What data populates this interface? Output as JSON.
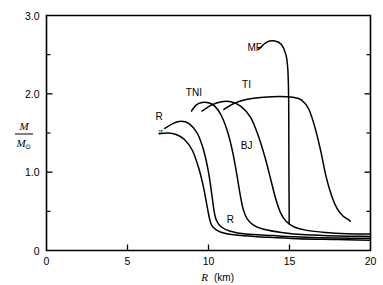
{
  "chart_data": {
    "type": "line",
    "title": "",
    "subtitle": "",
    "xlabel": "R",
    "xunit": "(km)",
    "ylabel_numerator": "M",
    "ylabel_denominator": "M",
    "ylabel_denominator_sub": "⊙",
    "xlim": [
      0,
      20
    ],
    "ylim": [
      0,
      3.0
    ],
    "x_ticks": [
      0,
      5,
      10,
      15,
      20
    ],
    "x_tick_labels": [
      "0",
      "5",
      "10",
      "15",
      "20"
    ],
    "x_minor_ticks": [],
    "y_ticks": [
      0,
      1.0,
      2.0,
      3.0
    ],
    "y_tick_labels": [
      "0",
      "1.0",
      "2.0",
      "3.0"
    ],
    "y_minor_ticks": [
      0.5,
      1.5,
      2.5
    ],
    "grid": false,
    "legend_position": "inline-annotations",
    "line_color": "#000000",
    "background_color": "#ffffff",
    "series": [
      {
        "name": "π",
        "label": "π",
        "label_x": 7.05,
        "label_y": 1.49,
        "points": [
          [
            6.95,
            1.49
          ],
          [
            7.5,
            1.5
          ],
          [
            8.0,
            1.48
          ],
          [
            8.5,
            1.42
          ],
          [
            9.0,
            1.28
          ],
          [
            9.4,
            1.05
          ],
          [
            9.7,
            0.8
          ],
          [
            9.9,
            0.58
          ],
          [
            10.05,
            0.42
          ],
          [
            10.2,
            0.32
          ],
          [
            10.5,
            0.26
          ],
          [
            11.0,
            0.22
          ],
          [
            12.0,
            0.19
          ],
          [
            13.5,
            0.17
          ],
          [
            15.5,
            0.15
          ],
          [
            18.0,
            0.14
          ],
          [
            20.0,
            0.13
          ]
        ]
      },
      {
        "name": "R",
        "label": "R",
        "label_x": 6.95,
        "label_y": 1.66,
        "points": [
          [
            7.3,
            1.56
          ],
          [
            7.8,
            1.62
          ],
          [
            8.3,
            1.65
          ],
          [
            8.8,
            1.62
          ],
          [
            9.3,
            1.5
          ],
          [
            9.7,
            1.28
          ],
          [
            10.0,
            1.0
          ],
          [
            10.2,
            0.72
          ],
          [
            10.35,
            0.5
          ],
          [
            10.5,
            0.38
          ],
          [
            10.8,
            0.3
          ],
          [
            11.3,
            0.25
          ],
          [
            12.3,
            0.21
          ],
          [
            14.0,
            0.19
          ],
          [
            16.0,
            0.17
          ],
          [
            18.0,
            0.16
          ],
          [
            20.0,
            0.155
          ]
        ]
      },
      {
        "name": "R-lower",
        "label": "R",
        "label_x": 11.35,
        "label_y": 0.345,
        "points": []
      },
      {
        "name": "TNI",
        "label": "TNI",
        "label_x": 9.1,
        "label_y": 1.97,
        "points": [
          [
            8.95,
            1.78
          ],
          [
            9.25,
            1.86
          ],
          [
            9.6,
            1.89
          ],
          [
            10.0,
            1.885
          ],
          [
            10.4,
            1.84
          ],
          [
            10.8,
            1.72
          ],
          [
            11.2,
            1.5
          ],
          [
            11.5,
            1.25
          ],
          [
            11.75,
            0.97
          ],
          [
            11.95,
            0.72
          ],
          [
            12.15,
            0.52
          ],
          [
            12.4,
            0.4
          ],
          [
            12.8,
            0.32
          ],
          [
            13.4,
            0.27
          ],
          [
            14.5,
            0.23
          ],
          [
            16.0,
            0.2
          ],
          [
            18.0,
            0.185
          ],
          [
            20.0,
            0.18
          ]
        ]
      },
      {
        "name": "BJ",
        "label": "BJ",
        "label_x": 12.35,
        "label_y": 1.3,
        "points": [
          [
            9.6,
            1.78
          ],
          [
            10.2,
            1.86
          ],
          [
            10.8,
            1.9
          ],
          [
            11.4,
            1.9
          ],
          [
            12.0,
            1.84
          ],
          [
            12.6,
            1.7
          ],
          [
            13.1,
            1.45
          ],
          [
            13.5,
            1.18
          ],
          [
            13.85,
            0.9
          ],
          [
            14.15,
            0.66
          ],
          [
            14.45,
            0.48
          ],
          [
            14.8,
            0.37
          ],
          [
            15.3,
            0.3
          ],
          [
            16.0,
            0.26
          ],
          [
            17.2,
            0.23
          ],
          [
            18.6,
            0.215
          ],
          [
            20.0,
            0.21
          ]
        ]
      },
      {
        "name": "TI",
        "label": "TI",
        "label_x": 12.35,
        "label_y": 2.08,
        "points": [
          [
            10.95,
            1.8
          ],
          [
            11.6,
            1.88
          ],
          [
            12.4,
            1.93
          ],
          [
            13.4,
            1.955
          ],
          [
            14.4,
            1.965
          ],
          [
            15.2,
            1.955
          ],
          [
            15.75,
            1.92
          ],
          [
            16.2,
            1.8
          ],
          [
            16.6,
            1.55
          ],
          [
            16.95,
            1.25
          ],
          [
            17.25,
            0.95
          ],
          [
            17.6,
            0.7
          ],
          [
            17.95,
            0.53
          ],
          [
            18.3,
            0.44
          ],
          [
            18.6,
            0.4
          ],
          [
            18.75,
            0.375
          ]
        ]
      },
      {
        "name": "MF",
        "label": "MF",
        "label_x": 12.85,
        "label_y": 2.55,
        "points": [
          [
            13.1,
            2.57
          ],
          [
            13.6,
            2.66
          ],
          [
            14.1,
            2.675
          ],
          [
            14.5,
            2.63
          ],
          [
            14.78,
            2.5
          ],
          [
            14.9,
            2.3
          ],
          [
            14.95,
            1.9
          ],
          [
            14.96,
            1.3
          ],
          [
            14.97,
            0.8
          ],
          [
            14.98,
            0.5
          ],
          [
            14.98,
            0.34
          ]
        ]
      }
    ],
    "annotations": [
      {
        "text": "π",
        "x": 7.05,
        "y": 1.49
      },
      {
        "text": "R",
        "x": 6.95,
        "y": 1.66
      },
      {
        "text": "TNI",
        "x": 9.1,
        "y": 1.97
      },
      {
        "text": "TI",
        "x": 12.35,
        "y": 2.08
      },
      {
        "text": "MF",
        "x": 12.85,
        "y": 2.55
      },
      {
        "text": "BJ",
        "x": 12.35,
        "y": 1.3
      },
      {
        "text": "R",
        "x": 11.35,
        "y": 0.345
      }
    ]
  }
}
